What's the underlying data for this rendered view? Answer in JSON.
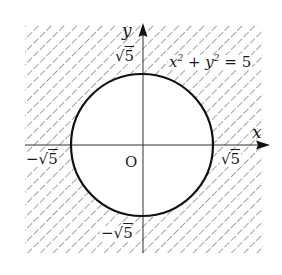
{
  "diagram": {
    "type": "region-plot",
    "equation_label": {
      "x_var": "x",
      "x_exp": "2",
      "plus": " + ",
      "y_var": "y",
      "y_exp": "2",
      "rhs": " = 5"
    },
    "axes": {
      "x_label": "x",
      "y_label": "y",
      "origin_label": "O"
    },
    "ticks": {
      "y_pos": {
        "radical": "√",
        "radicand": "5"
      },
      "y_neg": {
        "sign": "−",
        "radical": "√",
        "radicand": "5"
      },
      "x_pos": {
        "radical": "√",
        "radicand": "5"
      },
      "x_neg": {
        "sign": "−",
        "radical": "√",
        "radicand": "5"
      }
    },
    "circle": {
      "radius_value": "√5",
      "center": [
        0,
        0
      ],
      "stroke": "#111111"
    },
    "hatch": {
      "color": "#8a8a8a",
      "direction": "diagonal-up-right",
      "region": "outside circle"
    },
    "colors": {
      "axis": "#333333",
      "background": "#ffffff"
    }
  }
}
